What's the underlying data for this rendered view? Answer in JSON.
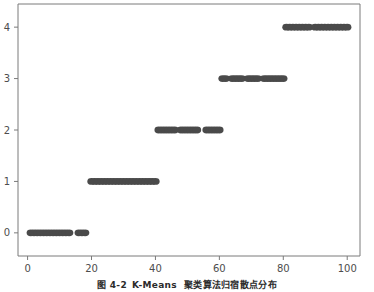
{
  "figure": {
    "caption_prefix": "图 4-2",
    "caption_algorithm": "K-Means",
    "caption_text": "聚类算法归宿散点分布",
    "background_color": "#ffffff",
    "marker_color": "#4a4a4a",
    "axis_color": "#7a7a7a",
    "tick_label_color": "#4d4d4d"
  },
  "chart_data": {
    "type": "scatter",
    "title": "",
    "xlabel": "",
    "ylabel": "",
    "xlim": [
      -3,
      104
    ],
    "ylim": [
      -0.45,
      4.45
    ],
    "grid": false,
    "legend": null,
    "xticks": [
      0,
      20,
      40,
      60,
      80,
      100
    ],
    "xtick_labels": [
      "0",
      "20",
      "40",
      "60",
      "80",
      "100"
    ],
    "yticks": [
      0,
      1,
      2,
      3,
      4
    ],
    "ytick_labels": [
      "0",
      "1",
      "2",
      "3",
      "4"
    ],
    "marker": "circle",
    "marker_size": 5,
    "series": [
      {
        "name": "cluster-0",
        "y": 0,
        "x": [
          1,
          2,
          3,
          4,
          5,
          6,
          7,
          8,
          9,
          10,
          11,
          12,
          13,
          16,
          17,
          18
        ]
      },
      {
        "name": "cluster-1",
        "y": 1,
        "x": [
          20,
          21,
          22,
          23,
          24,
          25,
          26,
          27,
          28,
          29,
          30,
          31,
          32,
          33,
          34,
          35,
          36,
          37,
          38,
          39,
          40
        ]
      },
      {
        "name": "cluster-2",
        "y": 2,
        "x": [
          41,
          42,
          43,
          44,
          45,
          46,
          48,
          49,
          50,
          51,
          52,
          53,
          56,
          57,
          58,
          59,
          60
        ]
      },
      {
        "name": "cluster-3",
        "y": 3,
        "x": [
          61,
          62,
          64,
          65,
          66,
          67,
          69,
          70,
          71,
          72,
          74,
          75,
          76,
          77,
          78,
          79,
          80
        ]
      },
      {
        "name": "cluster-4",
        "y": 4,
        "x": [
          81,
          82,
          83,
          84,
          85,
          86,
          87,
          88,
          90,
          91,
          92,
          93,
          94,
          95,
          96,
          97,
          98,
          99,
          100
        ]
      }
    ]
  }
}
